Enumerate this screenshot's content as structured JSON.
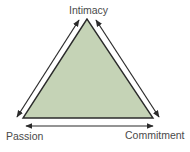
{
  "diagram": {
    "title": "",
    "nodes": [
      {
        "id": "intimacy",
        "label": "Intimacy",
        "position": "top"
      },
      {
        "id": "passion",
        "label": "Passion",
        "position": "bottom-left"
      },
      {
        "id": "commitment",
        "label": "Commitment",
        "position": "bottom-right"
      }
    ],
    "edges": [
      {
        "from": "passion",
        "to": "intimacy",
        "type": "double-arrow"
      },
      {
        "from": "intimacy",
        "to": "commitment",
        "type": "double-arrow"
      },
      {
        "from": "passion",
        "to": "commitment",
        "type": "double-arrow"
      }
    ],
    "colors": {
      "triangle_fill": "#c5d3b6",
      "triangle_stroke": "#2b2b2b",
      "arrow": "#2b2b2b",
      "label": "#4a4a4a"
    }
  }
}
